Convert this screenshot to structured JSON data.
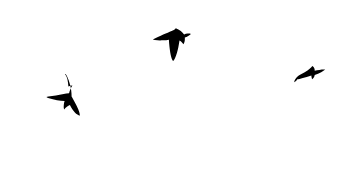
{
  "scene": {
    "title": "Three birds in flight silhouetted against sky",
    "width": 339,
    "height": 191,
    "background_color": "#ffffff",
    "silhouette_color": "#000000",
    "subject_count": 3,
    "caption": ""
  },
  "birds": [
    {
      "id": "bird-left",
      "label": "Left bird",
      "description": "Bird with upswept right wing, outstretched left wing and long forked tail",
      "pose": "wings-up-gliding",
      "bounds": {
        "x": 46,
        "y": 73,
        "width": 35,
        "height": 43
      },
      "center": {
        "x": 64,
        "y": 95
      },
      "color": "#000000",
      "size": "large"
    },
    {
      "id": "bird-top",
      "label": "Top centre bird",
      "description": "Bird with broad left wing sweeping outward and pointed tail angled down",
      "pose": "wings-spread-soaring",
      "bounds": {
        "x": 154,
        "y": 27,
        "width": 37,
        "height": 34
      },
      "center": {
        "x": 173,
        "y": 44
      },
      "color": "#000000",
      "size": "medium"
    },
    {
      "id": "bird-right",
      "label": "Right bird",
      "description": "Small distant bird with wings swept back",
      "pose": "wings-swept-back",
      "bounds": {
        "x": 294,
        "y": 65,
        "width": 32,
        "height": 19
      },
      "center": {
        "x": 310,
        "y": 74
      },
      "color": "#000000",
      "size": "small"
    }
  ]
}
